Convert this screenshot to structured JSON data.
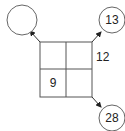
{
  "diagram": {
    "grid": {
      "rows": 2,
      "cols": 2,
      "cells": [
        [
          "",
          ""
        ],
        [
          "9",
          ""
        ]
      ],
      "side_label": "12"
    },
    "circles": {
      "top_left": "",
      "top_right": "13",
      "bottom_right": "28"
    },
    "colors": {
      "stroke": "#444444",
      "background": "#ffffff"
    }
  }
}
